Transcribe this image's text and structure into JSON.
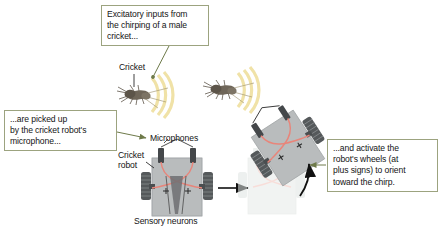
{
  "figure": {
    "background": "#ffffff"
  },
  "callouts": [
    {
      "id": "excitatory",
      "lines": [
        "Excitatory inputs from",
        "the chirping of a male",
        "cricket..."
      ],
      "border_color": "#9ca37f",
      "leader_to": "left-cricket"
    },
    {
      "id": "picked-up",
      "lines": [
        "...are picked up",
        "by the cricket robot's",
        "microphone..."
      ],
      "border_color": "#9ca37f",
      "leader_to": "microphones"
    },
    {
      "id": "activate",
      "lines": [
        "...and activate the",
        "robot's wheels (at",
        "plus signs) to orient",
        "toward the chirp."
      ],
      "border_color": "#9ca37f",
      "leader_to": "rotation-arrow"
    }
  ],
  "labels": {
    "cricket": "Cricket",
    "microphones": "Microphones",
    "cricket_robot_line1": "Cricket",
    "cricket_robot_line2": "robot",
    "sensory_neurons": "Sensory neurons"
  },
  "markers": {
    "plus_sign": "+",
    "plus_count": 4
  },
  "colors": {
    "callout_border": "#9ca37f",
    "leader_line": "#6e7a4a",
    "sound_wave": "#f2e4a8",
    "robot_body": "#b9bcbd",
    "robot_body_dark": "#a6aaab",
    "wheel": "#555a5c",
    "neuron_path": "#e8857a",
    "arrow": "#111111",
    "cricket_body": "#6b6357",
    "ghost_body": "#dfe3e1",
    "ghost_neuron": "#f0bfb8"
  },
  "scene": {
    "crickets": [
      {
        "id": "left-cricket",
        "x": 140,
        "y": 95,
        "chirping": true
      },
      {
        "id": "right-cricket",
        "x": 225,
        "y": 90,
        "chirping": true
      }
    ],
    "robots": [
      {
        "id": "robot-upright",
        "state": "before-turn",
        "wheels": 4,
        "microphones": 2,
        "plus_signs": 2
      },
      {
        "id": "robot-rotated",
        "state": "after-turn",
        "wheels": 4,
        "microphones": 2,
        "plus_signs": 2
      },
      {
        "id": "robot-ghost",
        "state": "previous-position",
        "faded": true
      }
    ],
    "arrows": [
      {
        "id": "transition-arrow",
        "type": "straight",
        "direction": "right"
      },
      {
        "id": "rotation-arrow",
        "type": "curved",
        "direction": "clockwise"
      }
    ]
  }
}
